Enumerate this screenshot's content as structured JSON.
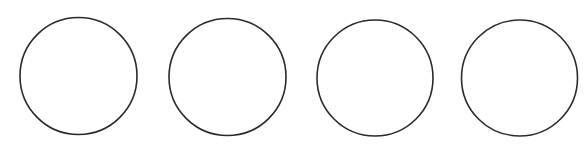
{
  "canvas": {
    "width": 588,
    "height": 161,
    "background": "#ffffff"
  },
  "shapes": {
    "stroke_color": "#2a2a2a",
    "stroke_width": 1.6,
    "fill": "#ffffff",
    "circles": [
      {
        "cx": 78.5,
        "cy": 76,
        "r": 58.5
      },
      {
        "cx": 227.5,
        "cy": 77,
        "r": 58.5
      },
      {
        "cx": 375,
        "cy": 78,
        "r": 58
      },
      {
        "cx": 519.5,
        "cy": 78,
        "r": 58
      }
    ]
  }
}
